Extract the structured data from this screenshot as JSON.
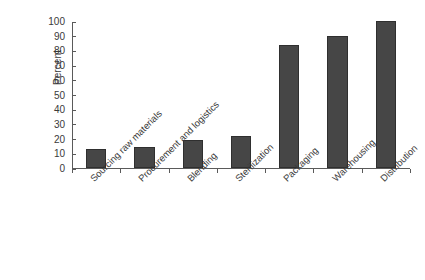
{
  "chart_data": {
    "type": "bar",
    "title": "",
    "subtitle": "",
    "xlabel": "",
    "ylabel": "Percent",
    "categories": [
      "Sourcing raw materials",
      "Procurement and logistics",
      "Blending",
      "Sterilization",
      "Packaging",
      "Warehousing",
      "Distribution"
    ],
    "values": [
      13,
      14,
      19,
      22,
      84,
      90,
      100
    ],
    "ylim": [
      0,
      100
    ],
    "yticks": [
      0,
      10,
      20,
      30,
      40,
      50,
      60,
      70,
      80,
      90,
      100
    ],
    "ytick_labels": [
      "0",
      "10",
      "20",
      "30",
      "40",
      "50",
      "60",
      "70",
      "80",
      "90",
      "100"
    ],
    "grid": false,
    "legend": null,
    "legend_position": "none",
    "bar_color": "#464646",
    "bar_edge_color": "#2f2f2f",
    "axis_color": "#5a5a5a",
    "text_color": "#3a3a3a",
    "background_color": "#ffffff",
    "xlabel_rotation": -45
  }
}
